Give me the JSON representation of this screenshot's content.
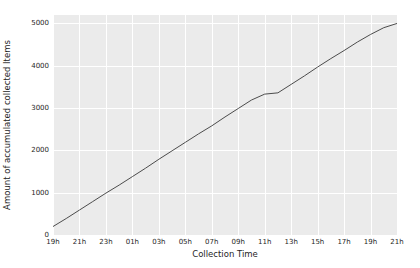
{
  "chart_data": {
    "type": "line",
    "title": "",
    "xlabel": "Collection Time",
    "ylabel": "Amount of accumulated collected Items",
    "x_tick_labels": [
      "19h",
      "21h",
      "23h",
      "01h",
      "03h",
      "05h",
      "07h",
      "09h",
      "11h",
      "13h",
      "15h",
      "17h",
      "19h",
      "21h"
    ],
    "y_tick_labels": [
      "0",
      "1000",
      "2000",
      "3000",
      "4000",
      "5000"
    ],
    "y_ticks": [
      0,
      1000,
      2000,
      3000,
      4000,
      5000
    ],
    "ylim": [
      0,
      5200
    ],
    "xlim": [
      0,
      26
    ],
    "grid": true,
    "legend": null,
    "series": [
      {
        "name": "accumulated collected items",
        "color": "#4c4c4c",
        "x": [
          0,
          1,
          2,
          3,
          4,
          5,
          6,
          7,
          8,
          9,
          10,
          11,
          12,
          13,
          14,
          15,
          16,
          17,
          18,
          19,
          20,
          21,
          22,
          23,
          24,
          25,
          26
        ],
        "values": [
          200,
          390,
          590,
          790,
          990,
          1180,
          1380,
          1580,
          1790,
          1990,
          2190,
          2390,
          2580,
          2790,
          2990,
          3190,
          3330,
          3360,
          3560,
          3760,
          3970,
          4170,
          4360,
          4560,
          4740,
          4900,
          5000
        ]
      }
    ]
  },
  "style": {
    "plot_background": "#ebebeb",
    "grid_color": "#ffffff",
    "figure_background": "#ffffff",
    "line_color": "#4c4c4c",
    "tick_text_color": "#262626"
  }
}
